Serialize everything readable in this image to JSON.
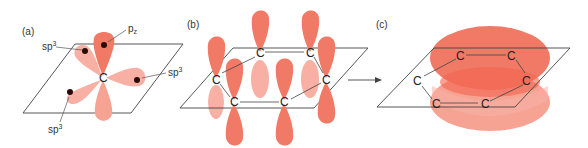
{
  "figure": {
    "colors": {
      "lobe_dark": "#f07a66",
      "lobe_light": "#f7b0a3",
      "ring_cloud": "#f26a55",
      "ring_cloud_light": "#f8a99b",
      "plane_stroke": "#444444",
      "nucleus": "#2a0a08",
      "text": "#333333"
    }
  },
  "panels": [
    {
      "id": "a",
      "label": "(a)",
      "center_atom": "C",
      "orbital_labels": [
        {
          "text": "p",
          "sub": "z"
        },
        {
          "text": "sp",
          "sup": "3"
        },
        {
          "text": "sp",
          "sup": "3"
        },
        {
          "text": "sp",
          "sup": "3"
        }
      ]
    },
    {
      "id": "b",
      "label": "(b)",
      "atoms": [
        "C",
        "C",
        "C",
        "C",
        "C",
        "C"
      ]
    },
    {
      "id": "c",
      "label": "(c)",
      "atoms": [
        "C",
        "C",
        "C",
        "C",
        "C",
        "C"
      ]
    }
  ],
  "arrow": {
    "direction": "right",
    "from": "b",
    "to": "c"
  }
}
